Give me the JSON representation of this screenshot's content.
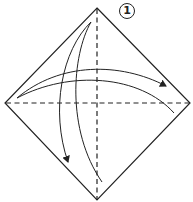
{
  "diagram": {
    "type": "origami-fold-instructions",
    "step": {
      "number": "1",
      "label": "①"
    },
    "shape": "square-rotated-45-deg",
    "colors": {
      "line": "#222222",
      "background": "#ffffff"
    },
    "fold_lines": [
      {
        "kind": "valley-fold",
        "style": "dashed",
        "orientation": "vertical"
      },
      {
        "kind": "valley-fold",
        "style": "dashed",
        "orientation": "horizontal"
      }
    ],
    "arrows": [
      {
        "name": "fold-top-to-bottom-arrow",
        "direction": "top-to-bottom",
        "style": "fold-and-unfold"
      },
      {
        "name": "fold-left-to-right-arrow",
        "direction": "left-to-right",
        "style": "fold-and-unfold"
      }
    ]
  }
}
